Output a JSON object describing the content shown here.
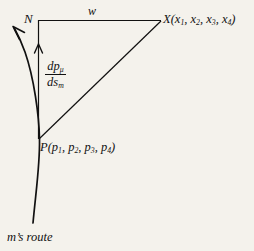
{
  "figure": {
    "background_color": "#f4f2ec",
    "ink_color": "#111111",
    "caption": "m's route",
    "labels": {
      "vertex_n": "N",
      "side_w": "w",
      "vertex_x_name": "X",
      "vertex_x_args": "(x1, x2, x3, x4)",
      "vertex_p_name": "P",
      "vertex_p_args": "(p1, p2, p3, p4)",
      "derivative_numerator": "dp",
      "derivative_numerator_sub": "μ",
      "derivative_denominator": "ds",
      "derivative_denominator_sub": "m"
    },
    "geometry": {
      "vertex_n": [
        38,
        20
      ],
      "vertex_x": [
        161,
        20
      ],
      "vertex_p": [
        39,
        139
      ],
      "arrow_on_vertical": [
        39,
        45
      ],
      "route_arrow_tip": [
        13,
        27
      ],
      "route_end": [
        33,
        223
      ]
    }
  }
}
